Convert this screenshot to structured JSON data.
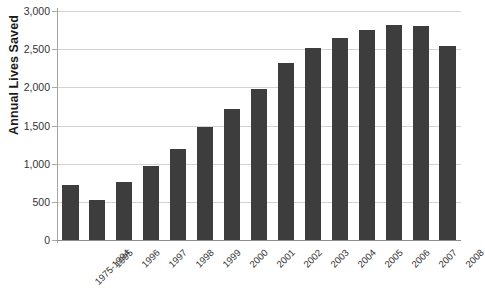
{
  "chart_data": {
    "type": "bar",
    "title": "",
    "xlabel": "",
    "ylabel": "Annual Lives Saved",
    "ylim": [
      0,
      3000
    ],
    "ytick_labels": [
      "3,000",
      "2,500",
      "2,000",
      "1,500",
      "1,000",
      "500",
      "0"
    ],
    "ytick_values": [
      3000,
      2500,
      2000,
      1500,
      1000,
      500,
      0
    ],
    "grid": true,
    "legend": false,
    "bar_color": "#3d3d3d",
    "gridline_color": "#d3d3d3",
    "axis_color": "#a6a6a6",
    "categories": [
      "1975-1994",
      "1995",
      "1996",
      "1997",
      "1998",
      "1999",
      "2000",
      "2001",
      "2002",
      "2003",
      "2004",
      "2005",
      "2006",
      "2007",
      "2008"
    ],
    "values": [
      720,
      525,
      765,
      965,
      1195,
      1485,
      1715,
      1975,
      2325,
      2520,
      2650,
      2755,
      2820,
      2800,
      2545
    ]
  }
}
